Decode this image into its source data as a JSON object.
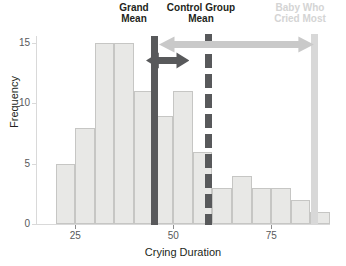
{
  "chart_data": {
    "type": "bar",
    "title": "",
    "xlabel": "Crying Duration",
    "ylabel": "Frequency",
    "xlim": [
      15,
      90
    ],
    "ylim": [
      0,
      15.6
    ],
    "xticks": [
      25,
      50,
      75
    ],
    "yticks": [
      0,
      5,
      10,
      15
    ],
    "grid": false,
    "bin_width": 5,
    "bin_starts": [
      20,
      25,
      30,
      35,
      40,
      45,
      50,
      55,
      60,
      65,
      70,
      75,
      80,
      85
    ],
    "categories": [
      "20-25",
      "25-30",
      "30-35",
      "35-40",
      "40-45",
      "45-50",
      "50-55",
      "55-60",
      "60-65",
      "65-70",
      "70-75",
      "75-80",
      "80-85",
      "85-90"
    ],
    "values": [
      5,
      8,
      15,
      15,
      11,
      9,
      11,
      6,
      3,
      4,
      3,
      3,
      2,
      1
    ],
    "bar_fill": "#e8e8e6",
    "bar_stroke": "#c6c6c4",
    "annotations": [
      {
        "name": "grand-mean",
        "label": "Grand\nMean",
        "x_value": 45,
        "style": "solid",
        "color": "#58595b"
      },
      {
        "name": "control-group-mean",
        "label": "Control Group\nMean",
        "x_value": 59,
        "style": "dashed",
        "color": "#58595b"
      },
      {
        "name": "baby-who-cried-most",
        "label": "Baby Who\nCried Most",
        "x_value": 86,
        "style": "dotted",
        "color": "#d4d4d4"
      }
    ],
    "arrows": [
      {
        "name": "long-span-arrow",
        "from_value": 46.5,
        "to_value": 86,
        "color": "#c9c9c9",
        "double_headed": true
      },
      {
        "name": "short-span-arrow",
        "from_value": 45,
        "to_value": 54,
        "color": "#58595b",
        "double_headed": true
      }
    ]
  },
  "axes": {
    "y_title": "Frequency",
    "x_title": "Crying Duration",
    "y_tick_labels": [
      "0",
      "5",
      "10",
      "15"
    ],
    "x_tick_labels": [
      "25",
      "50",
      "75"
    ]
  },
  "labels": {
    "grand_mean": "Grand\nMean",
    "control_group_mean": "Control Group\nMean",
    "baby_who_cried_most": "Baby Who\nCried Most"
  },
  "colors": {
    "bar_fill": "#e8e8e6",
    "bar_stroke": "#c6c6c4",
    "dark_marker": "#58595b",
    "light_marker": "#d4d4d4",
    "text": "#231f20",
    "tick_text": "#58595b",
    "axis_line": "#d9d9d9"
  }
}
